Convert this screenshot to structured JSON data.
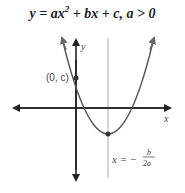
{
  "title": {
    "prefix": "y = ax",
    "exponent": "2",
    "suffix": " + bx + c, a > 0"
  },
  "labels": {
    "y_axis": "y",
    "x_axis": "x",
    "y_intercept": "(0, c)",
    "axis_of_symmetry_lhs": "x = −",
    "axis_of_symmetry_num": "b",
    "axis_of_symmetry_den": "2a"
  },
  "colors": {
    "axes": "#222222",
    "curve": "#555555",
    "symmetry_line": "#aaaaaa",
    "point": "#333333"
  }
}
